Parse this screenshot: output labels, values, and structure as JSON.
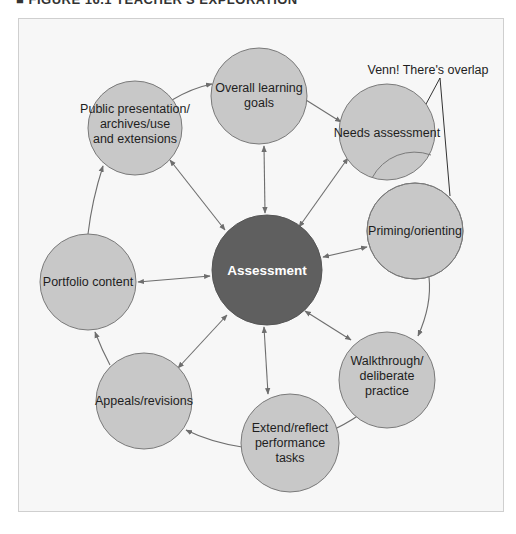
{
  "figure": {
    "header": "■ FIGURE 16.1  TEACHER'S EXPLORATION",
    "colors": {
      "background": "#f7f7f7",
      "node_fill": "#c8c8c8",
      "node_stroke": "#7a7a7a",
      "center_fill": "#5f5f5f",
      "overlap_fill": "#9a9a9a",
      "arrow": "#6e6e6e"
    }
  },
  "center": {
    "label": "Assessment"
  },
  "nodes": [
    {
      "id": "overall",
      "lines": [
        "Overall learning",
        "goals"
      ]
    },
    {
      "id": "needs",
      "lines": [
        "Needs assessment"
      ]
    },
    {
      "id": "priming",
      "lines": [
        "Priming/orienting"
      ]
    },
    {
      "id": "walkthrough",
      "lines": [
        "Walkthrough/",
        "deliberate",
        "practice"
      ]
    },
    {
      "id": "extend",
      "lines": [
        "Extend/reflect",
        "performance",
        "tasks"
      ]
    },
    {
      "id": "appeals",
      "lines": [
        "Appeals/revisions"
      ]
    },
    {
      "id": "portfolio",
      "lines": [
        "Portfolio content"
      ]
    },
    {
      "id": "public",
      "lines": [
        "Public presentation/",
        "archives/use",
        "and extensions"
      ]
    }
  ],
  "callout": {
    "label": "Venn! There's overlap"
  }
}
